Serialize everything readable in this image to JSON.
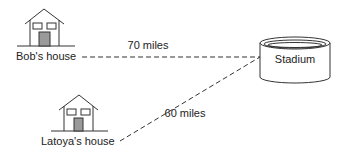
{
  "diagram": {
    "locations": {
      "bob_house": {
        "label": "Bob's house"
      },
      "latoya_house": {
        "label": "Latoya's house"
      },
      "stadium": {
        "label": "Stadium"
      }
    },
    "connections": [
      {
        "from": "Bob's house",
        "to": "Stadium",
        "label": "70 miles"
      },
      {
        "from": "Latoya's house",
        "to": "Stadium",
        "label": "60 miles"
      }
    ],
    "colors": {
      "stroke": "#333333",
      "door": "#9a9a9a",
      "text": "#222222"
    }
  }
}
